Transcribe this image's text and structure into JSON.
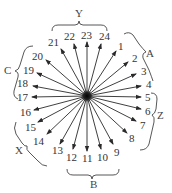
{
  "diagram": {
    "center": {
      "x": 87,
      "y": 96
    },
    "rays": [
      {
        "label": "1",
        "tip": [
          116,
          51
        ],
        "text": [
          118,
          50
        ]
      },
      {
        "label": "2",
        "tip": [
          128,
          62
        ],
        "text": [
          132,
          62
        ]
      },
      {
        "label": "3",
        "tip": [
          136,
          74
        ],
        "text": [
          141,
          75
        ]
      },
      {
        "label": "4",
        "tip": [
          141,
          86
        ],
        "text": [
          146,
          88
        ]
      },
      {
        "label": "5",
        "tip": [
          141,
          97
        ],
        "text": [
          145,
          101
        ]
      },
      {
        "label": "6",
        "tip": [
          141,
          109
        ],
        "text": [
          145,
          115
        ]
      },
      {
        "label": "7",
        "tip": [
          136,
          121
        ],
        "text": [
          140,
          129
        ]
      },
      {
        "label": "8",
        "tip": [
          127,
          133
        ],
        "text": [
          129,
          142
        ]
      },
      {
        "label": "9",
        "tip": [
          113,
          144
        ],
        "text": [
          114,
          156
        ]
      },
      {
        "label": "10",
        "tip": [
          101,
          149
        ],
        "text": [
          97,
          161
        ]
      },
      {
        "label": "11",
        "tip": [
          87,
          151
        ],
        "text": [
          82,
          162
        ]
      },
      {
        "label": "12",
        "tip": [
          73,
          149
        ],
        "text": [
          66,
          161
        ]
      },
      {
        "label": "13",
        "tip": [
          60,
          144
        ],
        "text": [
          52,
          154
        ]
      },
      {
        "label": "14",
        "tip": [
          47,
          134
        ],
        "text": [
          33,
          145
        ]
      },
      {
        "label": "15",
        "tip": [
          38,
          122
        ],
        "text": [
          25,
          131
        ]
      },
      {
        "label": "16",
        "tip": [
          34,
          110
        ],
        "text": [
          20,
          116
        ]
      },
      {
        "label": "17",
        "tip": [
          32,
          97
        ],
        "text": [
          17,
          101
        ]
      },
      {
        "label": "18",
        "tip": [
          33,
          86
        ],
        "text": [
          17,
          87
        ]
      },
      {
        "label": "19",
        "tip": [
          37,
          73
        ],
        "text": [
          23,
          74
        ]
      },
      {
        "label": "20",
        "tip": [
          46,
          60
        ],
        "text": [
          32,
          60
        ]
      },
      {
        "label": "21",
        "tip": [
          61,
          49
        ],
        "text": [
          48,
          46
        ]
      },
      {
        "label": "22",
        "tip": [
          74,
          44
        ],
        "text": [
          64,
          40
        ]
      },
      {
        "label": "23",
        "tip": [
          87,
          42
        ],
        "text": [
          81,
          39
        ]
      },
      {
        "label": "24",
        "tip": [
          101,
          44
        ],
        "text": [
          99,
          40
        ]
      }
    ],
    "groups": [
      {
        "label": "Y",
        "text": [
          75,
          17
        ],
        "members": [
          "21",
          "22",
          "23",
          "24"
        ]
      },
      {
        "label": "A",
        "text": [
          146,
          57
        ],
        "members": [
          "1",
          "2",
          "3",
          "4"
        ]
      },
      {
        "label": "Z",
        "text": [
          157,
          119
        ],
        "members": [
          "5",
          "6",
          "7",
          "8"
        ]
      },
      {
        "label": "B",
        "text": [
          90,
          188
        ],
        "members": [
          "9",
          "10",
          "11",
          "12"
        ]
      },
      {
        "label": "X",
        "text": [
          15,
          154
        ],
        "members": [
          "13",
          "14",
          "15",
          "16"
        ]
      },
      {
        "label": "C",
        "text": [
          4,
          74
        ],
        "members": [
          "17",
          "18",
          "19",
          "20"
        ]
      }
    ]
  }
}
